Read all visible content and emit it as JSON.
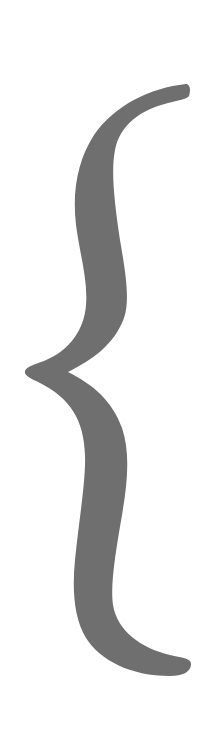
{
  "figure": {
    "glyph": "{",
    "orientation": "vertical",
    "colors": {
      "background": "#ffffff",
      "brace_fill": "#6f6f6f"
    }
  }
}
